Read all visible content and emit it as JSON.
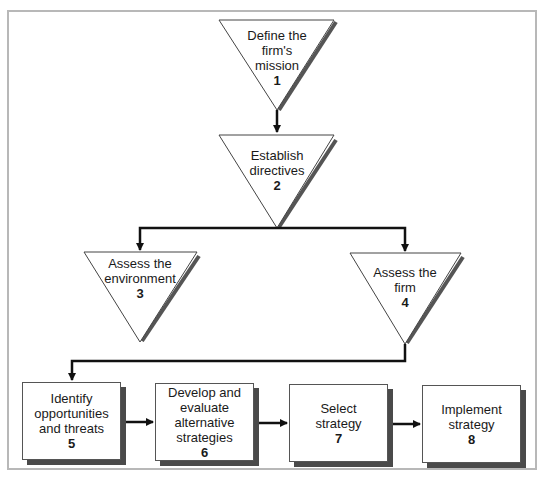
{
  "diagram": {
    "type": "strategic-planning-flowchart",
    "steps": [
      {
        "id": 1,
        "label": "Define the firm's mission",
        "lines": [
          "Define the",
          "firm's",
          "mission"
        ],
        "number": "1",
        "shape": "triangle"
      },
      {
        "id": 2,
        "label": "Establish directives",
        "lines": [
          "Establish",
          "directives"
        ],
        "number": "2",
        "shape": "triangle"
      },
      {
        "id": 3,
        "label": "Assess the environment",
        "lines": [
          "Assess the",
          "environment"
        ],
        "number": "3",
        "shape": "triangle"
      },
      {
        "id": 4,
        "label": "Assess the firm",
        "lines": [
          "Assess the",
          "firm"
        ],
        "number": "4",
        "shape": "triangle"
      },
      {
        "id": 5,
        "label": "Identify opportunities and threats",
        "lines": [
          "Identify",
          "opportunities",
          "and threats"
        ],
        "number": "5",
        "shape": "box"
      },
      {
        "id": 6,
        "label": "Develop and evaluate alternative strategies",
        "lines": [
          "Develop and",
          "evaluate",
          "alternative",
          "strategies"
        ],
        "number": "6",
        "shape": "box"
      },
      {
        "id": 7,
        "label": "Select strategy",
        "lines": [
          "Select",
          "strategy"
        ],
        "number": "7",
        "shape": "box"
      },
      {
        "id": 8,
        "label": "Implement strategy",
        "lines": [
          "Implement",
          "strategy"
        ],
        "number": "8",
        "shape": "box"
      }
    ],
    "edges": [
      {
        "from": 1,
        "to": 2
      },
      {
        "from": 2,
        "to": 3
      },
      {
        "from": 2,
        "to": 4
      },
      {
        "from": 4,
        "to": 5
      },
      {
        "from": 5,
        "to": 6
      },
      {
        "from": 6,
        "to": 7
      },
      {
        "from": 7,
        "to": 8
      }
    ],
    "colors": {
      "line": "#111111",
      "shadow": "#4a4a4a",
      "frame": "#b8b8b8",
      "fill": "#ffffff"
    }
  }
}
